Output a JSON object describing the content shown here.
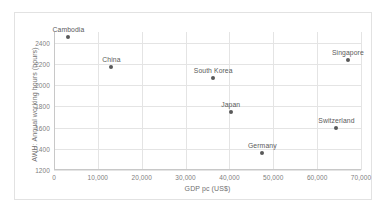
{
  "chart_data": {
    "type": "scatter",
    "title": "",
    "xlabel": "GDP pc (US$)",
    "ylabel": "AWH: Annual working hours (hours)",
    "xlim": [
      0,
      70000
    ],
    "ylim": [
      1200,
      2500
    ],
    "y_axis_display_max": 2500,
    "xticks": [
      0,
      10000,
      20000,
      30000,
      40000,
      50000,
      60000,
      70000
    ],
    "xtick_labels": [
      "0",
      "10,000",
      "20,000",
      "30,000",
      "40,000",
      "50,000",
      "60,000",
      "70,000"
    ],
    "yticks": [
      1200,
      1400,
      1600,
      1800,
      2000,
      2200,
      2400
    ],
    "ytick_labels": [
      "1200",
      "1400",
      "1600",
      "1800",
      "2000",
      "2200",
      "2400"
    ],
    "grid": true,
    "legend": false,
    "marker_color": "#595959",
    "grid_color": "#e4e4e4",
    "points": [
      {
        "label": "Cambodia",
        "x": 3300,
        "y": 2450
      },
      {
        "label": "China",
        "x": 13100,
        "y": 2174
      },
      {
        "label": "South Korea",
        "x": 36300,
        "y": 2063
      },
      {
        "label": "Japan",
        "x": 40300,
        "y": 1744
      },
      {
        "label": "Singapore",
        "x": 67000,
        "y": 2238
      },
      {
        "label": "Switzerland",
        "x": 64400,
        "y": 1597
      },
      {
        "label": "Germany",
        "x": 47500,
        "y": 1360
      }
    ]
  }
}
